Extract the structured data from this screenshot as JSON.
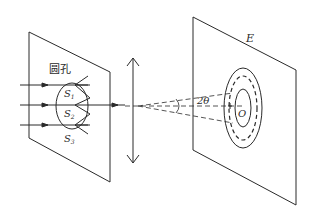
{
  "diagram": {
    "type": "optics-circular-aperture-diffraction",
    "aperture_label": "圆孔",
    "sources": [
      {
        "label": "S",
        "sub": "1"
      },
      {
        "label": "S",
        "sub": "2"
      },
      {
        "label": "S",
        "sub": "3"
      }
    ],
    "screen_label": "E",
    "center_label": "O",
    "angle_label": "2θ",
    "colors": {
      "line": "#2a2a2a",
      "background": "#ffffff"
    }
  }
}
